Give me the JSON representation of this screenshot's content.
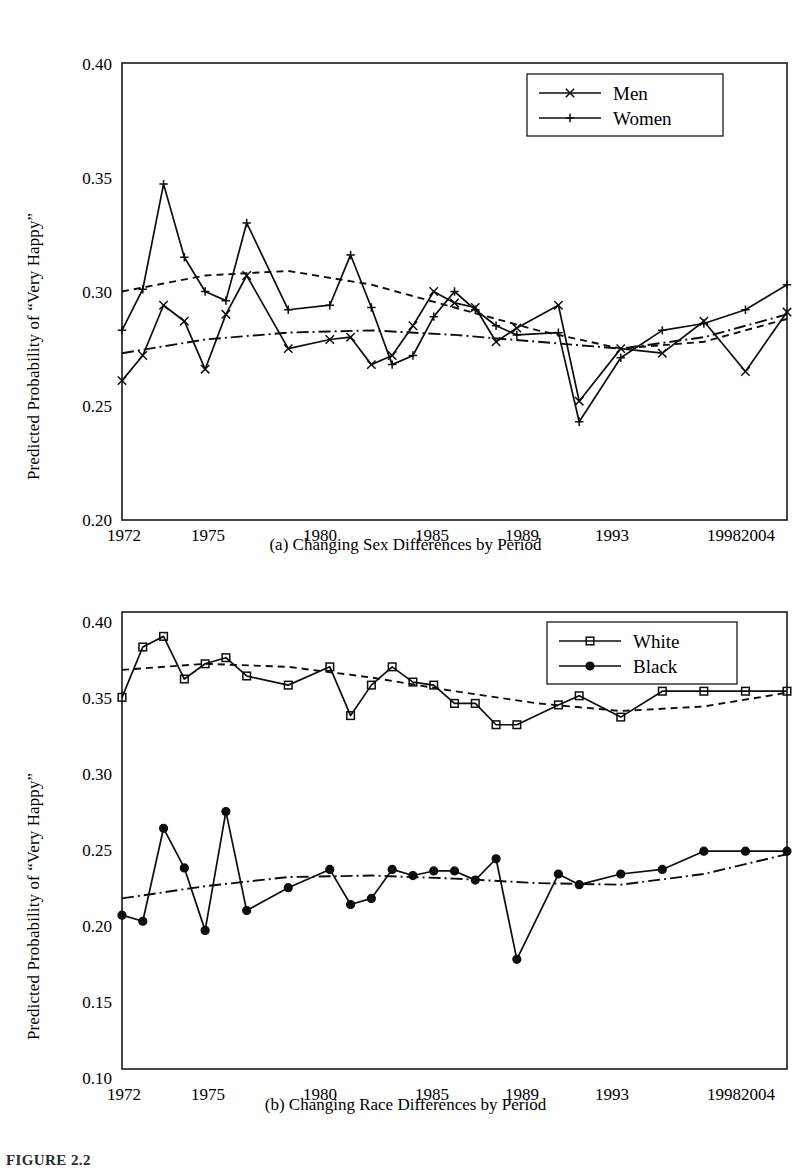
{
  "figure": {
    "note": "FIGURE 2.2",
    "ylabel": "Predicted Probability of “Very Happy”"
  },
  "chart_data": [
    {
      "id": "a",
      "type": "line",
      "title": "(a) Changing Sex Differences by Period",
      "xlabel": "",
      "ylabel": "Predicted Probability of “Very Happy”",
      "ylim": [
        0.2,
        0.4
      ],
      "yticks": [
        "0.20",
        "0.25",
        "0.30",
        "0.35",
        "0.40"
      ],
      "ytick_values": [
        0.2,
        0.25,
        0.3,
        0.35,
        0.4
      ],
      "xticks": [
        "1972",
        "1975",
        "1980",
        "1985",
        "1989",
        "1993",
        "1998",
        "2004"
      ],
      "xtick_values": [
        1972,
        1975,
        1980,
        1985,
        1989,
        1993,
        1998,
        2004
      ],
      "xlim": [
        1972,
        2004
      ],
      "grid": false,
      "legend_position": "top-right",
      "x": [
        1972,
        1973,
        1974,
        1975,
        1976,
        1977,
        1978,
        1980,
        1982,
        1983,
        1984,
        1985,
        1986,
        1987,
        1988,
        1989,
        1990,
        1991,
        1993,
        1994,
        1996,
        1998,
        2000,
        2002,
        2004
      ],
      "series": [
        {
          "name": "Men",
          "marker": "x",
          "style": "solid",
          "values": [
            0.261,
            0.272,
            0.294,
            0.287,
            0.266,
            0.29,
            0.307,
            0.275,
            0.279,
            0.28,
            0.268,
            0.272,
            0.285,
            0.3,
            0.295,
            0.293,
            0.278,
            0.284,
            0.294,
            0.252,
            0.275,
            0.273,
            0.287,
            0.265,
            0.291
          ],
          "trend": {
            "name": "Men trend",
            "style": "dash-dot"
          }
        },
        {
          "name": "Women",
          "marker": "+",
          "style": "solid",
          "values": [
            0.283,
            0.301,
            0.347,
            0.315,
            0.3,
            0.296,
            0.33,
            0.292,
            0.294,
            0.316,
            0.293,
            0.268,
            0.272,
            0.289,
            0.3,
            0.292,
            0.285,
            0.281,
            0.282,
            0.243,
            0.271,
            0.283,
            0.286,
            0.292,
            0.303
          ],
          "trend": {
            "name": "Women trend",
            "style": "dashed"
          }
        }
      ],
      "trend_lines": [
        {
          "name": "Women trend",
          "style": "dashed",
          "x": [
            1972,
            1976,
            1980,
            1984,
            1988,
            1992,
            1996,
            2000,
            2004
          ],
          "values": [
            0.3,
            0.307,
            0.309,
            0.303,
            0.293,
            0.283,
            0.275,
            0.278,
            0.288
          ]
        },
        {
          "name": "Men trend",
          "style": "dash-dot",
          "x": [
            1972,
            1976,
            1980,
            1984,
            1988,
            1992,
            1996,
            2000,
            2004
          ],
          "values": [
            0.273,
            0.279,
            0.282,
            0.283,
            0.281,
            0.278,
            0.275,
            0.28,
            0.29
          ]
        }
      ]
    },
    {
      "id": "b",
      "type": "line",
      "title": "(b) Changing Race Differences by Period",
      "xlabel": "",
      "ylabel": "Predicted Probability of “Very Happy”",
      "ylim": [
        0.1,
        0.4
      ],
      "yticks": [
        "0.10",
        "0.15",
        "0.20",
        "0.25",
        "0.30",
        "0.35",
        "0.40"
      ],
      "ytick_values": [
        0.1,
        0.15,
        0.2,
        0.25,
        0.3,
        0.35,
        0.4
      ],
      "xticks": [
        "1972",
        "1975",
        "1980",
        "1985",
        "1989",
        "1993",
        "1998",
        "2004"
      ],
      "xtick_values": [
        1972,
        1975,
        1980,
        1985,
        1989,
        1993,
        1998,
        2004
      ],
      "xlim": [
        1972,
        2004
      ],
      "grid": false,
      "legend_position": "top-right",
      "x": [
        1972,
        1973,
        1974,
        1975,
        1976,
        1977,
        1978,
        1980,
        1982,
        1983,
        1984,
        1985,
        1986,
        1987,
        1988,
        1989,
        1990,
        1991,
        1993,
        1994,
        1996,
        1998,
        2000,
        2002,
        2004
      ],
      "series": [
        {
          "name": "White",
          "marker": "open-square",
          "style": "solid",
          "values": [
            0.344,
            0.377,
            0.384,
            0.356,
            0.366,
            0.37,
            0.358,
            0.352,
            0.364,
            0.332,
            0.352,
            0.364,
            0.354,
            0.352,
            0.34,
            0.34,
            0.326,
            0.326,
            0.339,
            0.345,
            0.331,
            0.348,
            0.348,
            0.348,
            0.348
          ],
          "trend": {
            "name": "White trend",
            "style": "dashed"
          }
        },
        {
          "name": "Black",
          "marker": "filled-circle",
          "style": "solid",
          "values": [
            0.201,
            0.197,
            0.258,
            0.232,
            0.191,
            0.269,
            0.204,
            0.219,
            0.231,
            0.208,
            0.212,
            0.231,
            0.227,
            0.23,
            0.23,
            0.224,
            0.238,
            0.172,
            0.228,
            0.221,
            0.228,
            0.231,
            0.243,
            0.243,
            0.243
          ],
          "trend": {
            "name": "Black trend",
            "style": "dash-dot"
          }
        }
      ],
      "trend_lines": [
        {
          "name": "White trend",
          "style": "dashed",
          "x": [
            1972,
            1976,
            1980,
            1984,
            1988,
            1992,
            1996,
            2000,
            2004
          ],
          "values": [
            0.362,
            0.366,
            0.364,
            0.357,
            0.348,
            0.34,
            0.335,
            0.338,
            0.347
          ]
        },
        {
          "name": "Black trend",
          "style": "dash-dot",
          "x": [
            1972,
            1976,
            1980,
            1984,
            1988,
            1992,
            1996,
            2000,
            2004
          ],
          "values": [
            0.212,
            0.22,
            0.226,
            0.227,
            0.225,
            0.222,
            0.221,
            0.228,
            0.241
          ]
        }
      ]
    }
  ]
}
